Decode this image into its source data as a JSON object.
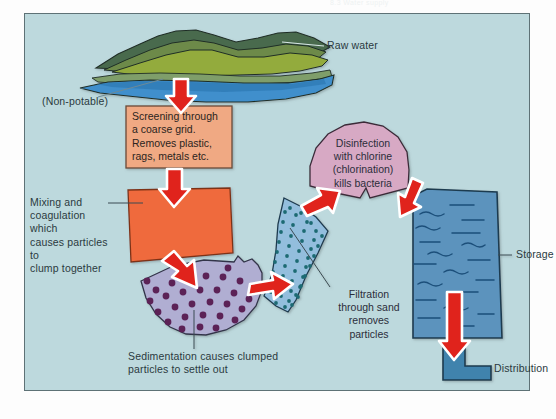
{
  "page": {
    "header_faint": "8.3 Water supply",
    "background_color": "#bdd9dd",
    "frame_border_color": "#5e7276",
    "arrow_color": "#e0231c",
    "arrow_outline_color": "#ffffff",
    "text_color": "#2b3a40"
  },
  "diagram": {
    "labels": {
      "raw_water": "Raw water",
      "non_potable": "(Non-potable)",
      "storage": "Storage",
      "distribution": "Distribution"
    },
    "stages": [
      {
        "id": "screening",
        "text": "Screening through a coarse grid. Removes plastic, rags, metals etc.",
        "lines": [
          "Screening through",
          "a coarse grid.",
          "Removes plastic,",
          "rags, metals etc."
        ],
        "fill_color": "#f0a983",
        "stroke_color": "#6b4a36",
        "shape": "rectangle"
      },
      {
        "id": "mixing-coagulation",
        "text": "Mixing and coagulation which causes particles to clump together",
        "lines": [
          "Mixing and",
          "coagulation which",
          "causes particles to",
          "clump together"
        ],
        "fill_color": "#ef6a3c",
        "stroke_color": "#7d3318",
        "shape": "quadrilateral"
      },
      {
        "id": "sedimentation",
        "text": "Sedimentation causes clumped particles to settle out",
        "lines": [
          "Sedimentation causes clumped",
          "particles to settle out"
        ],
        "fill_color": "#b0aed2",
        "stroke_color": "#33344a",
        "particle_color": "#5b2057",
        "particle_count": 30,
        "shape": "fan-wedge"
      },
      {
        "id": "filtration",
        "text": "Filtration through sand removes particles",
        "lines": [
          "Filtration",
          "through sand",
          "removes",
          "particles"
        ],
        "fill_color": "#93bedd",
        "stroke_color": "#1d3b4f",
        "particle_color": "#1d6b73",
        "particle_count": 60,
        "shape": "fan-wedge"
      },
      {
        "id": "disinfection",
        "text": "Disinfection with chlorine (chlorination) kills bacteria",
        "lines": [
          "Disinfection",
          "with chlorine",
          "(chlorination)",
          "kills bacteria"
        ],
        "fill_color": "#d7a9c4",
        "stroke_color": "#3b2b39",
        "shape": "dome-wedge"
      },
      {
        "id": "storage",
        "text": "Storage",
        "lines": [
          "Storage"
        ],
        "fill_color": "#5b93bd",
        "stroke_color": "#1d3b4f",
        "shape": "tank"
      },
      {
        "id": "distribution",
        "text": "Distribution",
        "lines": [
          "Distribution"
        ],
        "fill_color": "#3f83ad",
        "stroke_color": "#1d3b4f",
        "shape": "pipe-elbow"
      }
    ],
    "landscape": {
      "water_color": "#3f8fcc",
      "grass_color": "#93ab3c",
      "hill_dark_color": "#4a6b4e",
      "hill_mid_color": "#6d8a4a",
      "stroke_color": "#1f2e26"
    },
    "arrow_count": 6
  }
}
